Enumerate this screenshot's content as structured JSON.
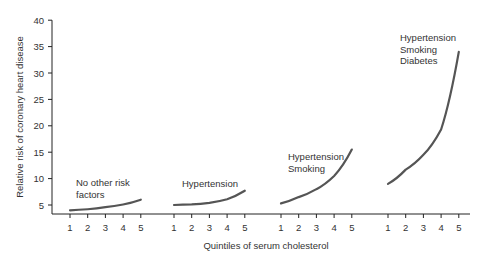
{
  "chart_data": {
    "type": "line",
    "title": "",
    "xlabel": "Quintiles of serum cholesterol",
    "ylabel": "Relative risk of coronary heart disease",
    "ylim": [
      3,
      40
    ],
    "yticks": [
      5,
      10,
      15,
      20,
      25,
      30,
      35,
      40
    ],
    "categories": [
      "1",
      "2",
      "3",
      "4",
      "5"
    ],
    "grid": false,
    "legend": "none (inline labels)",
    "series": [
      {
        "name": "No other risk factors",
        "label_lines": [
          "No other risk",
          "factors"
        ],
        "values": [
          4.0,
          4.2,
          4.6,
          5.1,
          6.0
        ]
      },
      {
        "name": "Hypertension",
        "label_lines": [
          "Hypertension"
        ],
        "values": [
          5.0,
          5.1,
          5.4,
          6.1,
          7.7
        ]
      },
      {
        "name": "Hypertension Smoking",
        "label_lines": [
          "Hypertension",
          "Smoking"
        ],
        "values": [
          5.3,
          6.5,
          8.0,
          10.5,
          15.5
        ]
      },
      {
        "name": "Hypertension Smoking Diabetes",
        "label_lines": [
          "Hypertension",
          "Smoking",
          "Diabetes"
        ],
        "values": [
          9.0,
          11.7,
          14.5,
          19.3,
          34.0
        ]
      }
    ]
  },
  "colors": {
    "line": "#555555",
    "axis": "#222222",
    "text": "#333333"
  }
}
